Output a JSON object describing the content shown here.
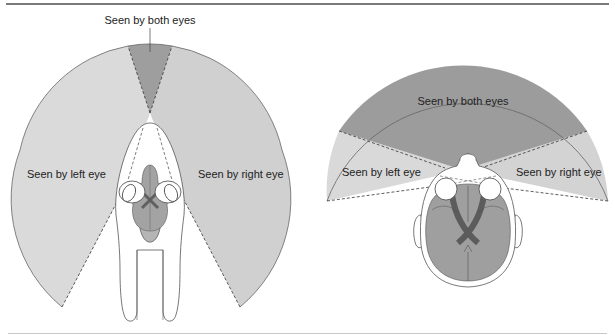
{
  "figure": {
    "left_panel": {
      "subject": "horse-head-top-view",
      "labels": {
        "both": "Seen by both eyes",
        "left": "Seen by left eye",
        "right": "Seen by right eye"
      }
    },
    "right_panel": {
      "subject": "human-head-top-view",
      "labels": {
        "both": "Seen by both eyes",
        "left": "Seen by left eye",
        "right": "Seen by right eye"
      }
    },
    "colors": {
      "monocular_fill": "#d9d9d9",
      "binocular_fill": "#9a9a9a",
      "brain_fill": "#9c9c9c",
      "brain_light": "#b3b3b3",
      "outline": "#555555",
      "top_rule": "#7a7a7a"
    }
  }
}
